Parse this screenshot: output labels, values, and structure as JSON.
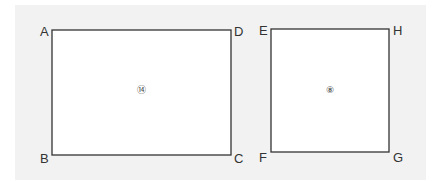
{
  "diagram": {
    "colors": {
      "background": "#f2f2f2",
      "shape_fill": "#ffffff",
      "stroke": "#333333"
    },
    "shapes": [
      {
        "id": "rect-abcd",
        "vertices": [
          "A",
          "B",
          "C",
          "D"
        ],
        "center_label": "⑭"
      },
      {
        "id": "rect-efgh",
        "vertices": [
          "E",
          "F",
          "G",
          "H"
        ],
        "center_label": "⑧"
      }
    ],
    "labels": {
      "A": "A",
      "B": "B",
      "C": "C",
      "D": "D",
      "E": "E",
      "F": "F",
      "G": "G",
      "H": "H",
      "r1": "⑭",
      "r2": "⑧"
    }
  }
}
